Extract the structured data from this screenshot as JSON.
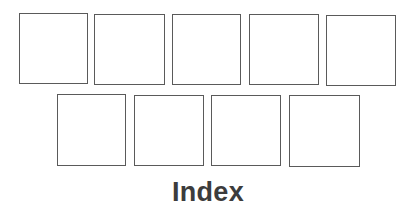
{
  "page": {
    "title": "Index"
  },
  "grid": {
    "rows": [
      {
        "tiles": [
          {
            "id": 1,
            "label": ""
          },
          {
            "id": 2,
            "label": ""
          },
          {
            "id": 3,
            "label": ""
          },
          {
            "id": 4,
            "label": ""
          },
          {
            "id": 5,
            "label": ""
          }
        ]
      },
      {
        "tiles": [
          {
            "id": 6,
            "label": ""
          },
          {
            "id": 7,
            "label": ""
          },
          {
            "id": 8,
            "label": ""
          },
          {
            "id": 9,
            "label": ""
          }
        ]
      }
    ],
    "border_color": "#5a5a5a",
    "tile_fill": "#ffffff"
  }
}
